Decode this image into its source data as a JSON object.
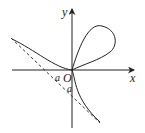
{
  "diagram": {
    "labels": {
      "x_axis": "x",
      "y_axis": "y",
      "origin": "O",
      "intercept_x": "a",
      "intercept_y": "a"
    },
    "colors": {
      "stroke": "#222222",
      "background": "#ffffff"
    }
  }
}
